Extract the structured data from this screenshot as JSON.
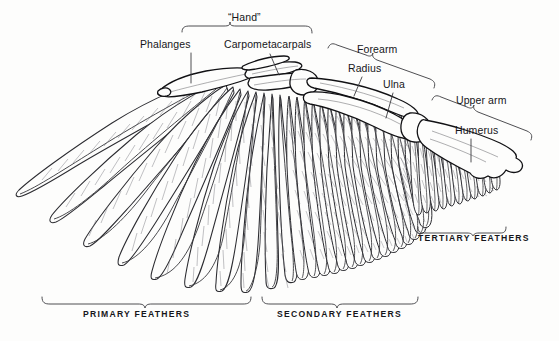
{
  "figure": {
    "background_color": "#fdfdfc",
    "ink_color": "#16161a",
    "line_color": "#3a3a3e"
  },
  "bone_labels": [
    {
      "id": "phalanges",
      "text": "Phalanges",
      "x": 140,
      "y": 44
    },
    {
      "id": "carpometacarpals",
      "text": "Carpometacarpals",
      "x": 224,
      "y": 44
    },
    {
      "id": "radius",
      "text": "Radius",
      "x": 348,
      "y": 68
    },
    {
      "id": "ulna",
      "text": "Ulna",
      "x": 383,
      "y": 84
    },
    {
      "id": "humerus",
      "text": "Humerus",
      "x": 455,
      "y": 130
    }
  ],
  "region_labels": [
    {
      "id": "hand",
      "text": "“Hand”",
      "x": 228,
      "y": 17
    },
    {
      "id": "forearm",
      "text": "Forearm",
      "x": 357,
      "y": 49
    },
    {
      "id": "upper-arm",
      "text": "Upper arm",
      "x": 456,
      "y": 100
    }
  ],
  "feather_groups": [
    {
      "id": "primary",
      "text": "PRIMARY FEATHERS",
      "x": 83,
      "y": 314
    },
    {
      "id": "secondary",
      "text": "SECONDARY FEATHERS",
      "x": 277,
      "y": 314
    },
    {
      "id": "tertiary",
      "text": "TERTIARY FEATHERS",
      "x": 418,
      "y": 238
    }
  ],
  "anatomy": {
    "feather_counts": {
      "primary": 10,
      "secondary": 16,
      "tertiary": 11
    },
    "bones": [
      "Phalanges",
      "Carpometacarpals",
      "Radius",
      "Ulna",
      "Humerus"
    ],
    "regions": [
      "“Hand”",
      "Forearm",
      "Upper arm"
    ]
  }
}
